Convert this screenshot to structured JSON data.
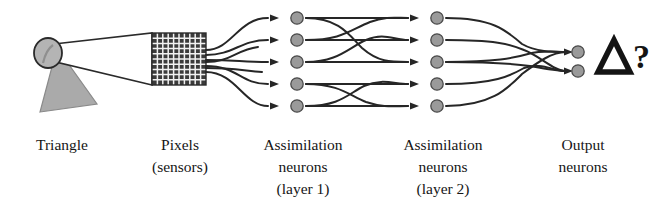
{
  "figure": {
    "background_color": "#ffffff",
    "ink_color": "#1a1a1a",
    "neuron_fill": "#9a9a9a",
    "neuron_stroke": "#4a4a4a",
    "grid_color": "#3b3b3b",
    "lens_fill": "#b4b4b4",
    "triangle_fill": "#aaaaaa"
  },
  "labels": [
    {
      "id": "triangle",
      "lines": [
        "Triangle"
      ],
      "x": 62
    },
    {
      "id": "pixels",
      "lines": [
        "Pixels",
        "(sensors)"
      ],
      "x": 180
    },
    {
      "id": "layer1",
      "lines": [
        "Assimilation",
        "neurons",
        "(layer 1)"
      ],
      "x": 303
    },
    {
      "id": "layer2",
      "lines": [
        "Assimilation",
        "neurons",
        "(layer 2)"
      ],
      "x": 443
    },
    {
      "id": "output",
      "lines": [
        "Output",
        "neurons"
      ],
      "x": 583
    }
  ],
  "stimulus": {
    "name": "triangle-stimulus",
    "shape": "triangle",
    "lens_label": "lens"
  },
  "sensor_grid": {
    "name": "pixel-grid",
    "columns": 10,
    "rows": 10,
    "x": 152,
    "y": 33,
    "width": 54,
    "height": 52
  },
  "layers": [
    {
      "id": "layer-1",
      "neuron_count": 5,
      "x": 297,
      "neuron_y": [
        18,
        40,
        62,
        84,
        106
      ]
    },
    {
      "id": "layer-2",
      "neuron_count": 5,
      "x": 437,
      "neuron_y": [
        18,
        40,
        62,
        84,
        106
      ]
    },
    {
      "id": "output",
      "neuron_count": 2,
      "x": 578,
      "neuron_y": [
        52,
        71
      ]
    }
  ],
  "output_symbol": {
    "name": "triangle-query-symbol",
    "glyph": "Δ",
    "query": "?"
  }
}
